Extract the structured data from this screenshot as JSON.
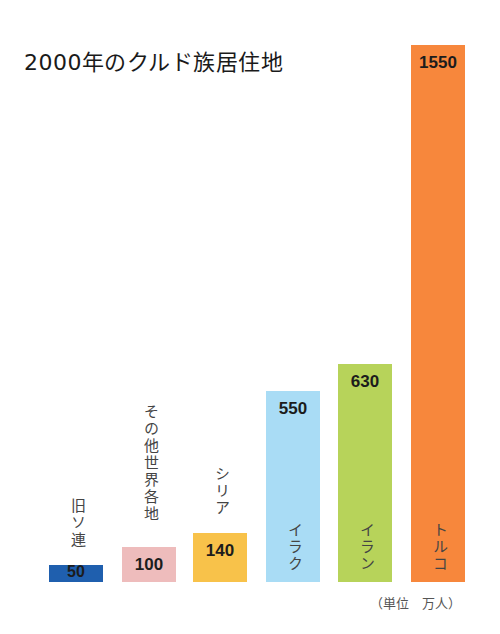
{
  "title": "2000年のクルド族居住地",
  "unit": "（単位　万人）",
  "chart_data": {
    "type": "bar",
    "title": "2000年のクルド族居住地",
    "categories": [
      "旧ソ連",
      "その他世界各地",
      "シリア",
      "イラク",
      "イラン",
      "トルコ"
    ],
    "values": [
      50,
      100,
      140,
      550,
      630,
      1550
    ],
    "value_labels": [
      "50",
      "100",
      "140",
      "550",
      "630",
      "1550"
    ],
    "colors": [
      "#1f5fae",
      "#eebcbc",
      "#f8c24a",
      "#a9dcf5",
      "#b7d35a",
      "#f7873c"
    ],
    "xlabel": "",
    "ylabel": "",
    "unit": "万人",
    "grid": false,
    "legend": "none"
  }
}
